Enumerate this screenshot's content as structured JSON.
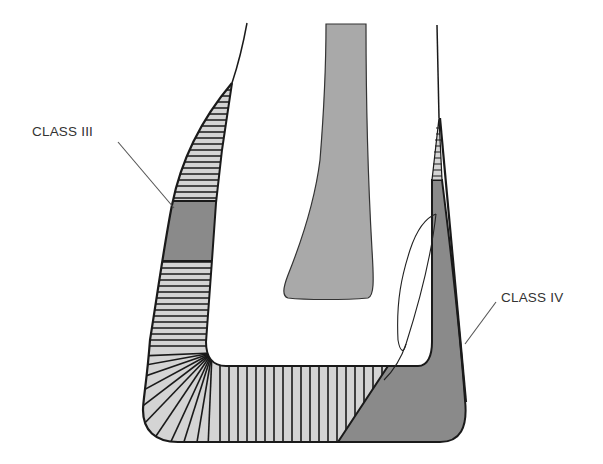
{
  "diagram": {
    "labels": [
      {
        "id": "class-iii",
        "text": "CLASS III"
      },
      {
        "id": "class-iv",
        "text": "CLASS IV"
      }
    ],
    "colors": {
      "dark_fill": "#8a8a8a",
      "light_fill": "#d4d4d4",
      "pulp_fill": "#a9a9a9",
      "outline": "#1a1a1a",
      "leader_line": "#555555",
      "background": "#ffffff"
    }
  }
}
